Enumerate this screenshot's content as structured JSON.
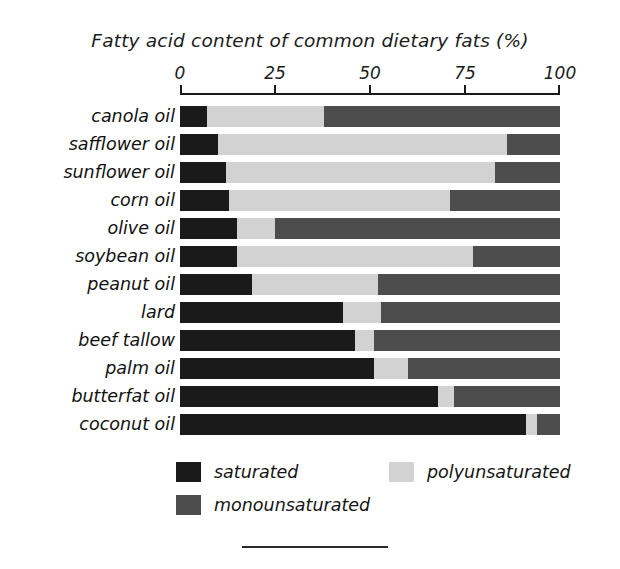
{
  "chart_data": {
    "type": "bar",
    "orientation": "horizontal",
    "stacked": true,
    "title": "Fatty acid content of common dietary fats (%)",
    "xlabel": "",
    "ylabel": "",
    "xlim": [
      0,
      100
    ],
    "xticks": [
      0,
      25,
      50,
      75,
      100
    ],
    "xtick_labels": [
      "0",
      "25",
      "50",
      "75",
      "100"
    ],
    "grid": false,
    "legend_position": "bottom",
    "categories": [
      "canola oil",
      "safflower oil",
      "sunflower oil",
      "corn oil",
      "olive oil",
      "soybean oil",
      "peanut oil",
      "lard",
      "beef tallow",
      "palm oil",
      "butterfat oil",
      "coconut oil"
    ],
    "series": [
      {
        "name": "saturated",
        "color": "#1a1a1a",
        "values": [
          7,
          10,
          12,
          13,
          15,
          15,
          19,
          43,
          46,
          51,
          68,
          91
        ]
      },
      {
        "name": "polyunsaturated",
        "color": "#d2d2d2",
        "values": [
          31,
          76,
          71,
          58,
          10,
          62,
          33,
          10,
          5,
          9,
          4,
          3
        ]
      },
      {
        "name": "monounsaturated",
        "color": "#4d4d4d",
        "values": [
          62,
          14,
          17,
          29,
          75,
          23,
          48,
          47,
          49,
          40,
          28,
          6
        ]
      }
    ]
  },
  "legend": {
    "items": [
      {
        "label": "saturated",
        "color": "#1a1a1a"
      },
      {
        "label": "polyunsaturated",
        "color": "#d2d2d2"
      },
      {
        "label": "monounsaturated",
        "color": "#4d4d4d"
      }
    ]
  }
}
